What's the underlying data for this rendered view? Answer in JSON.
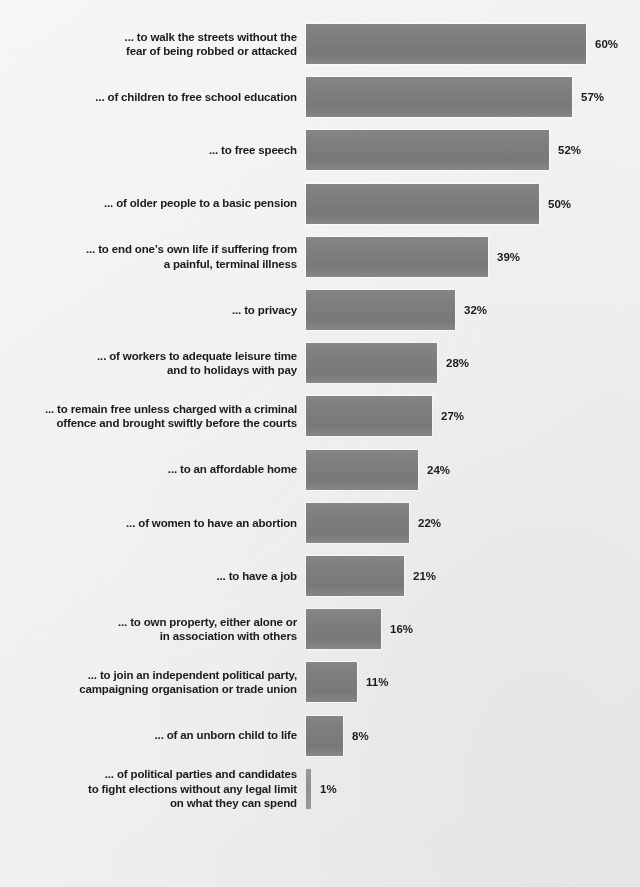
{
  "chart_data": {
    "type": "bar",
    "orientation": "horizontal",
    "title": "",
    "subtitle": "",
    "xlabel": "",
    "ylabel": "",
    "xlim": [
      0,
      60
    ],
    "grid": false,
    "legend": false,
    "value_suffix": "%",
    "bar_color": "#7e7e80",
    "background_color": "#f2f2f2",
    "text_color": "#1b1b1b",
    "categories": [
      "... to walk the streets without the\nfear of being robbed or attacked",
      "... of children to free school education",
      "... to free speech",
      "... of older people to a basic pension",
      "... to end one’s own life if suffering from\na painful, terminal illness",
      "... to privacy",
      "... of workers to adequate leisure time\nand to holidays with pay",
      "... to remain free unless charged with a criminal\noffence and brought swiftly before the courts",
      "... to an affordable home",
      "... of women to have an abortion",
      "... to have a job",
      "... to own property, either alone or\nin association with others",
      "... to join an independent political party,\ncampaigning organisation or trade union",
      "... of an unborn child to life",
      "... of political parties and candidates\nto fight elections without any legal limit\non what they can spend"
    ],
    "values": [
      60,
      57,
      52,
      50,
      39,
      32,
      28,
      27,
      24,
      22,
      21,
      16,
      11,
      8,
      1
    ],
    "value_labels": [
      "60%",
      "57%",
      "52%",
      "50%",
      "39%",
      "32%",
      "28%",
      "27%",
      "24%",
      "22%",
      "21%",
      "16%",
      "11%",
      "8%",
      "1%"
    ]
  }
}
